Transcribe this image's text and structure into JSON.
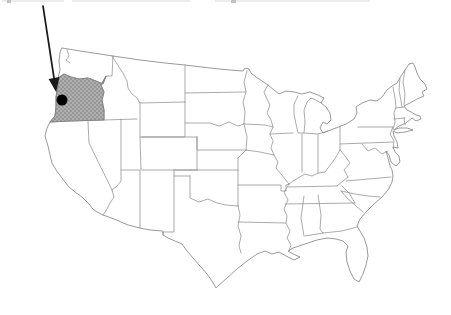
{
  "figure": {
    "title": "",
    "type": "us-state-locator-map",
    "highlighted_state": "Oregon",
    "marker": {
      "shape": "filled-circle",
      "description": "black location dot inside the highlighted state"
    },
    "arrow": {
      "description": "black arrow from top-left edge pointing to the location dot"
    },
    "top_edge": {
      "description": "faint cropped-off text remnants along the top edge"
    },
    "colors": {
      "background": "#ffffff",
      "state_border": "#8f8f8f",
      "highlight_border": "#808080",
      "highlight_fill": "#b0b0b0",
      "highlight_texture": "#757575",
      "marker": "#000000",
      "arrow": "#1a1a1a",
      "artifact": "#ececec"
    }
  }
}
